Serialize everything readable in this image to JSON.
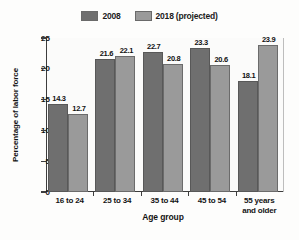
{
  "chart_data": {
    "type": "bar",
    "title": "",
    "xlabel": "Age group",
    "ylabel": "Percentage of labor force",
    "categories": [
      "16 to 24",
      "25 to 34",
      "35 to 44",
      "45 to 54",
      "55 years and older"
    ],
    "category_lines": [
      [
        "16 to 24"
      ],
      [
        "25 to 34"
      ],
      [
        "35 to 44"
      ],
      [
        "45 to 54"
      ],
      [
        "55 years",
        "and older"
      ]
    ],
    "series": [
      {
        "name": "2008",
        "color": "#6f6f6f",
        "values": [
          14.3,
          21.6,
          22.7,
          23.3,
          18.1
        ],
        "labels": [
          "14.3",
          "21.6",
          "22.7",
          "23.3",
          "18.1"
        ]
      },
      {
        "name": "2018 (projected)",
        "color": "#9a9a9a",
        "values": [
          12.7,
          22.1,
          20.8,
          20.6,
          23.9
        ],
        "labels": [
          "12.7",
          "22.1",
          "20.8",
          "20.6",
          "23.9"
        ]
      }
    ],
    "ylim": [
      0,
      25
    ],
    "yticks": [
      0,
      5,
      10,
      15,
      20,
      25
    ],
    "ytick_labels": [
      "0",
      "5",
      "10",
      "15",
      "20",
      "25"
    ],
    "grid": false,
    "legend_position": "top-center"
  }
}
